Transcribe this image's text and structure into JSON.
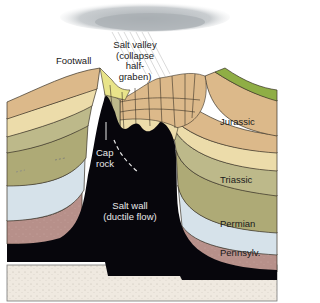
{
  "diagram": {
    "labels": {
      "footwall": "Footwall",
      "salt_valley_1": "Salt valley",
      "salt_valley_2": "(collapse",
      "salt_valley_3": "half-",
      "salt_valley_4": "graben)",
      "cap_rock_1": "Cap",
      "cap_rock_2": "rock",
      "salt_wall_1": "Salt wall",
      "salt_wall_2": "(ductile flow)",
      "jurassic": "Jurassic",
      "triassic": "Triassic",
      "permian": "Permian",
      "pennsylvanian": "Pennsylv."
    },
    "colors": {
      "cloud": "#b9bfc3",
      "upper_green": "#8fae45",
      "jurassic_upper": "#dcb98a",
      "jurassic_lower": "#ecdcaa",
      "triassic_upper": "#bdb98a",
      "triassic_lower": "#aeaa76",
      "valley_fill": "#e8e48a",
      "permian": "#d6e2ea",
      "pennsylvanian": "#b7908a",
      "salt": "#07060c",
      "basement": "#efe9e0"
    }
  }
}
